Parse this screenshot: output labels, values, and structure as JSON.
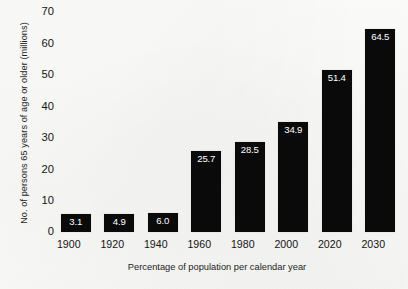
{
  "chart_data": {
    "type": "bar",
    "title": "",
    "xlabel": "Percentage of population per calendar year",
    "ylabel": "No. of persons 65 years of age or older (millions)",
    "categories": [
      "1900",
      "1920",
      "1940",
      "1960",
      "1980",
      "2000",
      "2020",
      "2030"
    ],
    "values": [
      3.1,
      4.9,
      6.0,
      25.7,
      28.5,
      34.9,
      51.4,
      64.5
    ],
    "value_labels": [
      "3.1",
      "4.9",
      "6.0",
      "25.7",
      "28.5",
      "34.9",
      "51.4",
      "64.5"
    ],
    "ylim": [
      0,
      70
    ],
    "yticks": [
      0,
      10,
      20,
      30,
      40,
      50,
      60,
      70
    ],
    "ytick_labels": [
      "0",
      "10",
      "20",
      "30",
      "40",
      "50",
      "60",
      "70"
    ],
    "grid": false,
    "legend": "none",
    "bar_color": "#0a0a0a",
    "value_label_color": "#ffffff",
    "background_color": "#fbfbf9"
  }
}
